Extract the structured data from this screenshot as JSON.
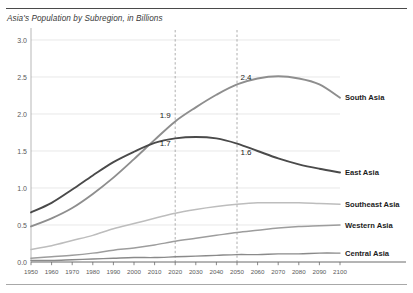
{
  "chart_data": {
    "type": "line",
    "title": "Asia's Population by Subregion, in Billions",
    "xlabel": "",
    "ylabel": "",
    "xlim": [
      1950,
      2100
    ],
    "ylim": [
      0.0,
      3.0
    ],
    "grid": "horizontal",
    "legend_position": "right-inline-labels",
    "y_ticks": [
      "0.0",
      "0.5",
      "1.0",
      "1.5",
      "2.0",
      "2.5",
      "3.0"
    ],
    "y_tick_values": [
      0.0,
      0.5,
      1.0,
      1.5,
      2.0,
      2.5,
      3.0
    ],
    "x_ticks": [
      "1950",
      "1960",
      "1970",
      "1980",
      "1990",
      "2000",
      "2010",
      "2020",
      "2030",
      "2040",
      "2050",
      "2060",
      "2070",
      "2080",
      "2090",
      "2100"
    ],
    "x_tick_values": [
      1950,
      1960,
      1970,
      1980,
      1990,
      2000,
      2010,
      2020,
      2030,
      2040,
      2050,
      2060,
      2070,
      2080,
      2090,
      2100
    ],
    "x": [
      1950,
      1960,
      1970,
      1980,
      1990,
      2000,
      2010,
      2020,
      2030,
      2040,
      2050,
      2060,
      2070,
      2080,
      2090,
      2100
    ],
    "reference_lines": [
      {
        "axis": "x",
        "value": 2020,
        "style": "dashed"
      },
      {
        "axis": "x",
        "value": 2050,
        "style": "dashed"
      }
    ],
    "annotations": [
      {
        "label": "1.9",
        "series": "South Asia",
        "x": 2020,
        "y": 1.9
      },
      {
        "label": "2.4",
        "series": "South Asia",
        "x": 2050,
        "y": 2.4
      },
      {
        "label": "1.7",
        "series": "East Asia",
        "x": 2020,
        "y": 1.7
      },
      {
        "label": "1.6",
        "series": "East Asia",
        "x": 2050,
        "y": 1.6
      }
    ],
    "series": [
      {
        "name": "South Asia",
        "color": "#8e8e8e",
        "values": [
          0.48,
          0.59,
          0.73,
          0.92,
          1.14,
          1.39,
          1.65,
          1.9,
          2.09,
          2.26,
          2.4,
          2.48,
          2.51,
          2.48,
          2.4,
          2.22
        ]
      },
      {
        "name": "East Asia",
        "color": "#4a4a4a",
        "values": [
          0.67,
          0.8,
          0.98,
          1.17,
          1.35,
          1.49,
          1.61,
          1.67,
          1.69,
          1.67,
          1.6,
          1.5,
          1.4,
          1.32,
          1.26,
          1.21
        ]
      },
      {
        "name": "Southeast Asia",
        "color": "#bdbdbd",
        "values": [
          0.17,
          0.22,
          0.29,
          0.36,
          0.45,
          0.52,
          0.59,
          0.66,
          0.71,
          0.75,
          0.78,
          0.8,
          0.8,
          0.8,
          0.79,
          0.78
        ]
      },
      {
        "name": "Western Asia",
        "color": "#9d9d9d",
        "values": [
          0.05,
          0.07,
          0.09,
          0.12,
          0.16,
          0.19,
          0.23,
          0.28,
          0.32,
          0.36,
          0.4,
          0.43,
          0.46,
          0.48,
          0.49,
          0.5
        ]
      },
      {
        "name": "Central Asia",
        "color": "#8a8a8a",
        "values": [
          0.02,
          0.02,
          0.03,
          0.04,
          0.05,
          0.06,
          0.06,
          0.07,
          0.08,
          0.09,
          0.1,
          0.1,
          0.11,
          0.11,
          0.12,
          0.12
        ]
      }
    ]
  }
}
